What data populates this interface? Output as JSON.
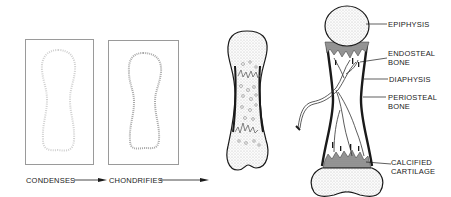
{
  "figure": {
    "stages": [
      {
        "id": "mesenchyme",
        "caption": "CONDENSES"
      },
      {
        "id": "cartilage-model",
        "caption": "CHONDRIFIES"
      },
      {
        "id": "primary-ossification",
        "caption": ""
      },
      {
        "id": "developing-long-bone",
        "caption": ""
      }
    ],
    "labels": {
      "epiphysis": "EPIPHYSIS",
      "endosteal_line1": "ENDOSTEAL",
      "endosteal_line2": "BONE",
      "diaphysis": "DIAPHYSIS",
      "periosteal_line1": "PERIOSTEAL",
      "periosteal_line2": "BONE",
      "calcified_line1": "CALCIFIED",
      "calcified_line2": "CARTILAGE"
    },
    "colors": {
      "outline": "#1a1a1a",
      "stipple": "#bdbdbd",
      "calcified": "#8a8a8a",
      "box_border": "#9a9a9a"
    }
  }
}
